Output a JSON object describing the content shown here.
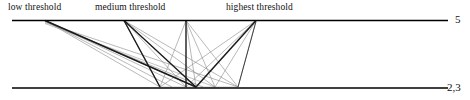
{
  "figure": {
    "width": 470,
    "height": 100,
    "background": "#ffffff",
    "ink_color": "#000000",
    "faint_edge_color": "#777777"
  },
  "column_labels": [
    {
      "id": "low",
      "text": "low threshold",
      "x": 8,
      "y": 2
    },
    {
      "id": "medium",
      "text": "medium threshold",
      "x": 95,
      "y": 2
    },
    {
      "id": "highest",
      "text": "highest threshold",
      "x": 226,
      "y": 2
    }
  ],
  "axis_labels": [
    {
      "id": "level-5",
      "text": "5",
      "x": 455,
      "y": 13
    },
    {
      "id": "level-23",
      "text": "2,3",
      "x": 447,
      "y": 81
    }
  ],
  "levels": [
    {
      "id": "top",
      "label": "5",
      "y": 20,
      "x_start": 12,
      "x_end": 448,
      "stroke_width": 1.4
    },
    {
      "id": "bottom",
      "label": "2,3",
      "y": 88,
      "x_start": 12,
      "x_end": 448,
      "stroke_width": 1.4
    }
  ],
  "nodes": {
    "top": [
      {
        "id": "t1",
        "x": 45,
        "y": 20,
        "group": "low"
      },
      {
        "id": "t2",
        "x": 124,
        "y": 20,
        "group": "medium"
      },
      {
        "id": "t3",
        "x": 186,
        "y": 20,
        "group": "medium"
      },
      {
        "id": "t4",
        "x": 256,
        "y": 20,
        "group": "highest"
      }
    ],
    "bottom": [
      {
        "id": "b1",
        "x": 160,
        "y": 88,
        "group": "medium"
      },
      {
        "id": "b2",
        "x": 186,
        "y": 88,
        "group": "medium"
      },
      {
        "id": "b3",
        "x": 196,
        "y": 88,
        "group": "highest"
      },
      {
        "id": "b4",
        "x": 238,
        "y": 88,
        "group": "highest"
      }
    ]
  },
  "edges": [
    {
      "from": "t1",
      "to": "b3",
      "weight": "heavy"
    },
    {
      "from": "t1",
      "to": "b1",
      "weight": "light"
    },
    {
      "from": "t1",
      "to": "b2",
      "weight": "light"
    },
    {
      "from": "t1",
      "to": "b4",
      "weight": "light"
    },
    {
      "from": "t1",
      "to": "b3",
      "weight": "light"
    },
    {
      "from": "t2",
      "to": "b1",
      "weight": "heavy"
    },
    {
      "from": "t2",
      "to": "b3",
      "weight": "heavy"
    },
    {
      "from": "t2",
      "to": "b2",
      "weight": "light"
    },
    {
      "from": "t2",
      "to": "b4",
      "weight": "light"
    },
    {
      "from": "t3",
      "to": "b2",
      "weight": "heavy"
    },
    {
      "from": "t3",
      "to": "b1",
      "weight": "light"
    },
    {
      "from": "t3",
      "to": "b3",
      "weight": "light"
    },
    {
      "from": "t3",
      "to": "b4",
      "weight": "light"
    },
    {
      "from": "t4",
      "to": "b3",
      "weight": "heavy"
    },
    {
      "from": "t4",
      "to": "b1",
      "weight": "light"
    },
    {
      "from": "t4",
      "to": "b2",
      "weight": "light"
    },
    {
      "from": "t4",
      "to": "b4",
      "weight": "light"
    }
  ]
}
